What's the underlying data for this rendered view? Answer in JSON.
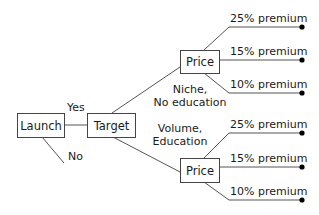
{
  "diagram": {
    "type": "decision-tree",
    "nodes": {
      "launch": "Launch",
      "target": "Target",
      "price_upper": "Price",
      "price_lower": "Price"
    },
    "edges": {
      "yes": "Yes",
      "no": "No",
      "niche_line1": "Niche,",
      "niche_line2": "No education",
      "volume_line1": "Volume,",
      "volume_line2": "Education"
    },
    "upper_options": [
      "25% premium",
      "15% premium",
      "10% premium"
    ],
    "lower_options": [
      "25% premium",
      "15% premium",
      "10% premium"
    ],
    "colors": {
      "line": "#555555",
      "text": "#1a1a1a",
      "dot": "#000000"
    }
  }
}
